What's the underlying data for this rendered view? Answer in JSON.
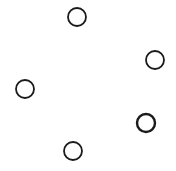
{
  "diagram": {
    "stroke_color": "#1a1a1a",
    "background": "#ffffff",
    "nodes": [
      {
        "id": "top",
        "label": ""
      },
      {
        "id": "right",
        "label": ""
      },
      {
        "id": "left",
        "label": ""
      },
      {
        "id": "lower-right",
        "label": ""
      },
      {
        "id": "bottom",
        "label": ""
      }
    ]
  }
}
